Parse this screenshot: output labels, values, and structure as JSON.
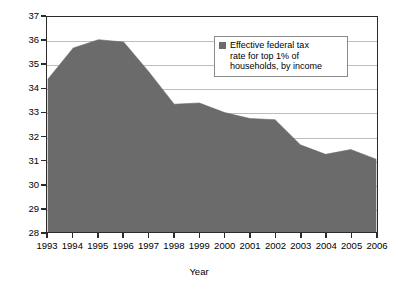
{
  "chart_data": {
    "type": "area",
    "title": "",
    "subtitle": "",
    "xlabel": "Year",
    "ylabel": "Tax rate (%)",
    "categories": [
      1993,
      1994,
      1995,
      1996,
      1997,
      1998,
      1999,
      2000,
      2001,
      2002,
      2003,
      2004,
      2005,
      2006
    ],
    "x_tick_labels": [
      "1993",
      "1994",
      "1995",
      "1996",
      "1997",
      "1998",
      "1999",
      "2000",
      "2001",
      "2002",
      "2003",
      "2004",
      "2005",
      "2006"
    ],
    "y_tick_labels": [
      "28",
      "29",
      "30",
      "31",
      "32",
      "33",
      "34",
      "35",
      "36",
      "37"
    ],
    "y_ticks": [
      28,
      29,
      30,
      31,
      32,
      33,
      34,
      35,
      36,
      37
    ],
    "ylim": [
      28,
      37
    ],
    "xlim": [
      1993,
      2006
    ],
    "grid": true,
    "grid_axis": "y",
    "legend_position": "top-right",
    "series": [
      {
        "name": "Effective federal tax rate for top 1% of households, by income",
        "color": "#6b6b6b",
        "values": [
          34.4,
          35.7,
          36.05,
          35.95,
          34.7,
          33.35,
          33.4,
          33.0,
          32.75,
          32.7,
          31.65,
          31.25,
          31.45,
          31.05
        ]
      }
    ],
    "legend_entries": [
      {
        "label": "Effective federal tax rate for top 1% of households, by income",
        "label_lines": [
          "Effective federal tax",
          "rate for top 1% of",
          "households, by income"
        ],
        "swatch_color": "#6b6b6b"
      }
    ],
    "colors": {
      "area_fill": "#6b6b6b",
      "axis": "#2b2b2b",
      "gridline": "#bdbdbd",
      "background": "#ffffff",
      "text": "#000000"
    }
  }
}
